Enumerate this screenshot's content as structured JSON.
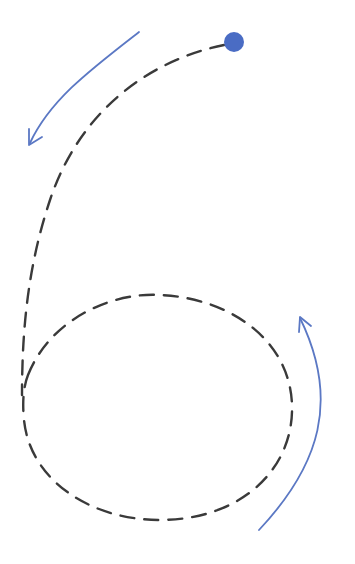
{
  "diagram": {
    "type": "numeral-tracing-guide",
    "numeral": "6",
    "colors": {
      "background": "#ffffff",
      "trace_path": "#3a3a3a",
      "arrow": "#5b78c4",
      "start_dot": "#4a6cc4"
    },
    "start_dot": {
      "cx": 234,
      "cy": 42,
      "r": 10
    },
    "trace_path": {
      "stroke_width": 2.4,
      "dash": "14 10",
      "stem": "M 224 45 C 150 60, 80 110, 50 200 C 30 260, 22 320, 22 395",
      "loop": "M 28 375 C 50 320, 110 292, 160 295 C 230 298, 290 340, 292 405 C 294 470, 240 520, 160 520 C 90 520, 30 480, 24 420 C 22 400, 24 385, 28 375"
    },
    "arrows": [
      {
        "name": "arrow-stroke-1-down",
        "path": "M 139 32 C 90 70, 50 100, 30 143",
        "head": "M 29 129 L 29 145 L 42 137"
      },
      {
        "name": "arrow-stroke-2-up",
        "path": "M 259 530 C 320 465, 340 400, 300 318",
        "head": "M 299 332 L 300 317 L 311 326"
      }
    ]
  }
}
